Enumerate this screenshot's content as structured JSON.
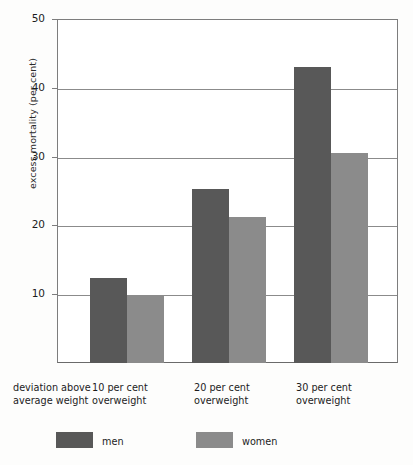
{
  "chart_data": {
    "type": "bar",
    "title": "",
    "subtitle": "",
    "xlabel": "deviation above average weight",
    "ylabel": "excess mortality (per cent)",
    "categories": [
      "10 per cent overweight",
      "20 per cent overweight",
      "30 per cent overweight"
    ],
    "category_lines": [
      [
        "10 per cent",
        "overweight"
      ],
      [
        "20 per cent",
        "overweight"
      ],
      [
        "30 per cent",
        "overweight"
      ]
    ],
    "series": [
      {
        "name": "men",
        "color": "#585858",
        "values": [
          12.3,
          25.3,
          43.0
        ]
      },
      {
        "name": "women",
        "color": "#8b8b8b",
        "values": [
          9.7,
          21.2,
          30.5
        ]
      }
    ],
    "ylim": [
      0,
      50
    ],
    "yticks": [
      10,
      20,
      30,
      40,
      50
    ],
    "ytick_labels": [
      "10",
      "20",
      "30",
      "40",
      "50"
    ],
    "grid": true,
    "legend_position": "bottom"
  },
  "axis": {
    "y_title": "excess mortality (per cent)",
    "x_corner_label_line1": "deviation above",
    "x_corner_label_line2": "average weight"
  },
  "legend": {
    "entries": [
      {
        "label": "men"
      },
      {
        "label": "women"
      }
    ]
  }
}
